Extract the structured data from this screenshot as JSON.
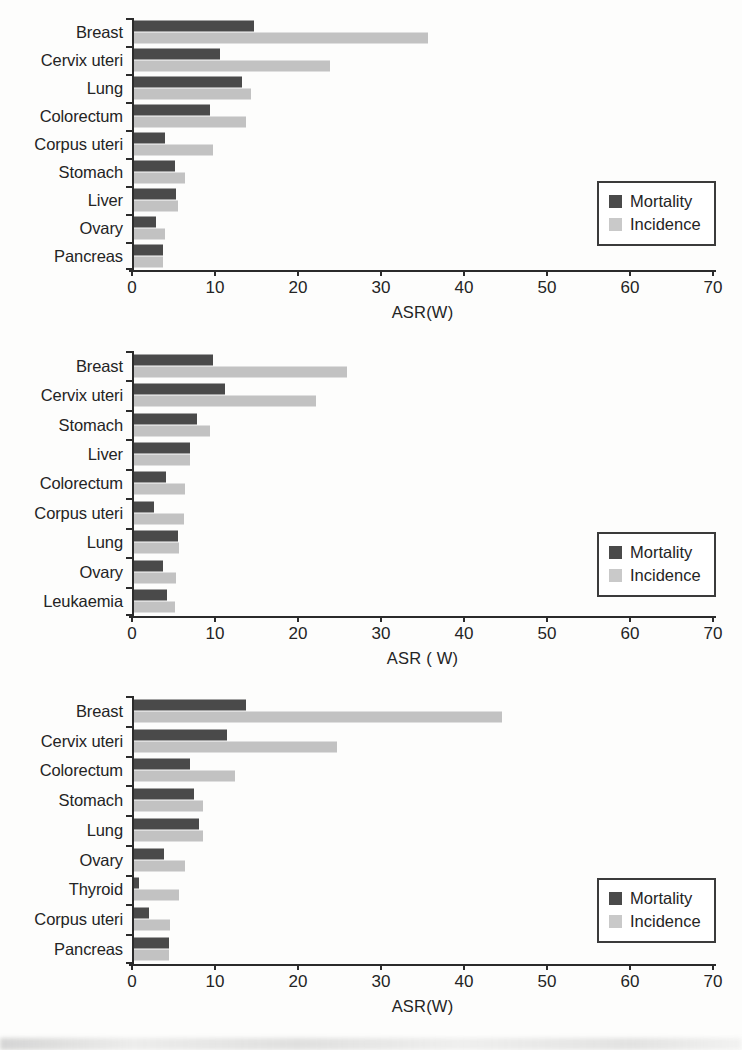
{
  "figure": {
    "background_color": "#fdfdfc",
    "mortality_color": "#4a4a4a",
    "incidence_color": "#c2c2c2",
    "axis_color": "#2b2b2b"
  },
  "legend": {
    "mortality_label": "Mortality",
    "incidence_label": "Incidence"
  },
  "chart_data": [
    {
      "type": "bar",
      "orientation": "horizontal",
      "title": "",
      "xlabel": "ASR(W)",
      "ylabel": "",
      "xlim": [
        0,
        70
      ],
      "xticks": [
        0,
        10,
        20,
        30,
        40,
        50,
        60,
        70
      ],
      "xticklabels": [
        "0",
        "10",
        "20",
        "30",
        "40",
        "50",
        "60",
        "70"
      ],
      "grid": false,
      "legend_position": "right",
      "legend_entries": [
        "Mortality",
        "Incidence"
      ],
      "categories": [
        "Breast",
        "Cervix uteri",
        "Lung",
        "Colorectum",
        "Corpus uteri",
        "Stomach",
        "Liver",
        "Ovary",
        "Pancreas"
      ],
      "series": [
        {
          "name": "Mortality",
          "values": [
            14.5,
            10.4,
            13.0,
            9.2,
            3.8,
            5.0,
            5.1,
            2.6,
            3.5
          ]
        },
        {
          "name": "Incidence",
          "values": [
            35.6,
            23.7,
            14.2,
            13.5,
            9.5,
            6.2,
            5.3,
            3.8,
            3.5
          ]
        }
      ]
    },
    {
      "type": "bar",
      "orientation": "horizontal",
      "title": "",
      "xlabel": "ASR ( W)",
      "ylabel": "",
      "xlim": [
        0,
        70
      ],
      "xticks": [
        0,
        10,
        20,
        30,
        40,
        50,
        60,
        70
      ],
      "xticklabels": [
        "0",
        "10",
        "20",
        "30",
        "40",
        "50",
        "60",
        "70"
      ],
      "grid": false,
      "legend_position": "right",
      "legend_entries": [
        "Mortality",
        "Incidence"
      ],
      "categories": [
        "Breast",
        "Cervix uteri",
        "Stomach",
        "Liver",
        "Colorectum",
        "Corpus uteri",
        "Lung",
        "Ovary",
        "Leukaemia"
      ],
      "series": [
        {
          "name": "Mortality",
          "values": [
            9.6,
            11.0,
            7.6,
            6.8,
            3.9,
            2.4,
            5.3,
            3.5,
            4.0
          ]
        },
        {
          "name": "Incidence",
          "values": [
            25.8,
            22.0,
            9.2,
            6.8,
            6.2,
            6.0,
            5.5,
            5.1,
            5.0
          ]
        }
      ]
    },
    {
      "type": "bar",
      "orientation": "horizontal",
      "title": "",
      "xlabel": "ASR(W)",
      "ylabel": "",
      "xlim": [
        0,
        70
      ],
      "xticks": [
        0,
        10,
        20,
        30,
        40,
        50,
        60,
        70
      ],
      "xticklabels": [
        "0",
        "10",
        "20",
        "30",
        "40",
        "50",
        "60",
        "70"
      ],
      "grid": false,
      "legend_position": "right",
      "legend_entries": [
        "Mortality",
        "Incidence"
      ],
      "categories": [
        "Breast",
        "Cervix uteri",
        "Colorectum",
        "Stomach",
        "Lung",
        "Ovary",
        "Thyroid",
        "Corpus uteri",
        "Pancreas"
      ],
      "series": [
        {
          "name": "Mortality",
          "values": [
            13.5,
            11.3,
            6.8,
            7.2,
            7.8,
            3.6,
            0.6,
            1.8,
            4.2
          ]
        },
        {
          "name": "Incidence",
          "values": [
            44.5,
            24.5,
            12.2,
            8.3,
            8.4,
            6.2,
            5.4,
            4.4,
            4.2
          ]
        }
      ]
    }
  ]
}
